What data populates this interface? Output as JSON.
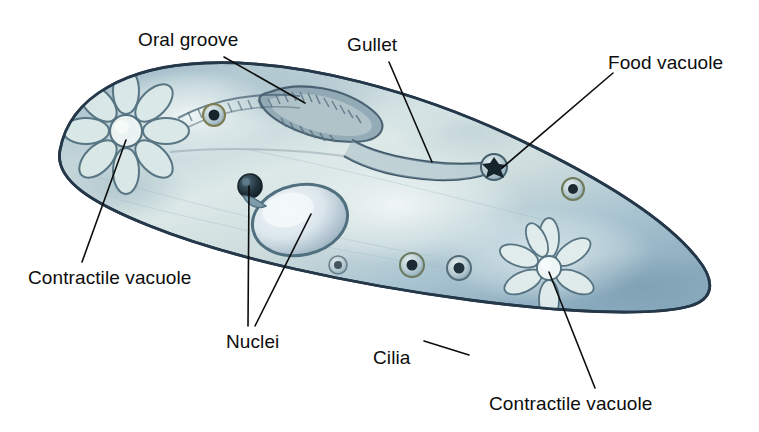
{
  "figure": {
    "title_fragment_cropped": "",
    "background_color": "#ffffff"
  },
  "labels": [
    {
      "id": "oral-groove",
      "text": "Oral groove",
      "x": 138,
      "y": 30
    },
    {
      "id": "gullet",
      "text": "Gullet",
      "x": 347,
      "y": 35
    },
    {
      "id": "food-vacuole",
      "text": "Food vacuole",
      "x": 608,
      "y": 53
    },
    {
      "id": "contractile-left",
      "text": "Contractile vacuole",
      "x": 28,
      "y": 268
    },
    {
      "id": "nuclei",
      "text": "Nuclei",
      "x": 226,
      "y": 332
    },
    {
      "id": "cilia",
      "text": "Cilia",
      "x": 373,
      "y": 348
    },
    {
      "id": "contractile-bottom",
      "text": "Contractile vacuole",
      "x": 489,
      "y": 394
    }
  ],
  "leader_lines": [
    {
      "for": "oral-groove",
      "from": [
        224,
        57
      ],
      "to": [
        305,
        103
      ]
    },
    {
      "for": "gullet",
      "from": [
        389,
        62
      ],
      "to": [
        432,
        162
      ]
    },
    {
      "for": "food-vacuole",
      "from": [
        613,
        73
      ],
      "to": [
        502,
        168
      ]
    },
    {
      "for": "contractile-left",
      "from": [
        126,
        140
      ],
      "to": [
        82,
        262
      ]
    },
    {
      "for": "nuclei",
      "from": [
        249,
        186
      ],
      "to": [
        248,
        326
      ]
    },
    {
      "for": "nuclei-2",
      "from": [
        311,
        214
      ],
      "to": [
        255,
        326
      ]
    },
    {
      "for": "cilia",
      "from": [
        469,
        355
      ],
      "to": [
        424,
        341
      ]
    },
    {
      "for": "contractile-bottom",
      "from": [
        549,
        272
      ],
      "to": [
        595,
        388
      ]
    }
  ],
  "structures": {
    "cell_body": {
      "name": "paramecium-body",
      "shape": "elongated-slipper",
      "fill_colors": [
        "#b9ccd3",
        "#d6e3e5",
        "#9fbcc8",
        "#8fb0bf"
      ],
      "outline_color": "#2b3f4d"
    },
    "cilia": {
      "name": "cilia-fringe",
      "color": "#b4ab8a",
      "count_approx": 150
    },
    "contractile_vacuole_left": {
      "name": "contractile-vacuole-star",
      "cx": 126,
      "cy": 131,
      "rays": 8
    },
    "contractile_vacuole_right": {
      "name": "contractile-vacuole-star",
      "cx": 549,
      "cy": 268,
      "rays": 7
    },
    "macronucleus": {
      "name": "macronucleus",
      "cx": 300,
      "cy": 220,
      "rx": 47,
      "ry": 34
    },
    "micronucleus": {
      "name": "micronucleus",
      "cx": 250,
      "cy": 186,
      "r": 11
    },
    "oral_groove": {
      "name": "oral-groove",
      "cx": 330,
      "cy": 112
    },
    "gullet": {
      "name": "gullet",
      "path_start": [
        352,
        130
      ],
      "path_end": [
        490,
        168
      ]
    },
    "food_vacuoles": [
      {
        "name": "food-vacuole",
        "cx": 494,
        "cy": 167,
        "r": 12
      },
      {
        "name": "food-vacuole",
        "cx": 214,
        "cy": 115,
        "r": 10
      },
      {
        "name": "food-vacuole",
        "cx": 573,
        "cy": 189,
        "r": 10
      },
      {
        "name": "food-vacuole",
        "cx": 412,
        "cy": 265,
        "r": 11
      },
      {
        "name": "food-vacuole",
        "cx": 459,
        "cy": 268,
        "r": 11
      },
      {
        "name": "food-vacuole",
        "cx": 338,
        "cy": 265,
        "r": 9
      }
    ]
  },
  "colors": {
    "ink": "#0d0d0d",
    "cell_light": "#dfeaea",
    "cell_mid": "#b6c9d2",
    "cell_dark": "#7e9fb1",
    "cell_outline": "#24384a",
    "cilia": "#b3aa87",
    "vacuole_dark": "#1d2a33"
  }
}
